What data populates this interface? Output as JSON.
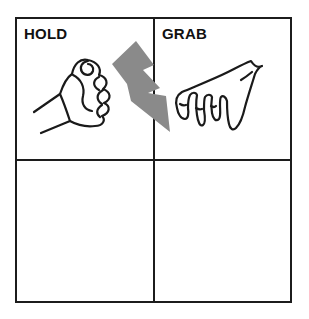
{
  "figure": {
    "kind": "2x2 quadrant diagram",
    "cells": [
      {
        "position": "top-left",
        "label": "HOLD",
        "illustration": "holding-fist-hand"
      },
      {
        "position": "top-right",
        "label": "GRAB",
        "illustration": "grabbing-hand"
      },
      {
        "position": "bottom-left",
        "label": ""
      },
      {
        "position": "bottom-right",
        "label": ""
      }
    ],
    "bolt": {
      "icon": "lightning-bolt",
      "color": "#8a8a8a"
    },
    "colors": {
      "background": "#ffffff",
      "grid_line": "#1c1c1c",
      "drawing_line": "#1a1a1a",
      "label_text": "#111111"
    }
  }
}
